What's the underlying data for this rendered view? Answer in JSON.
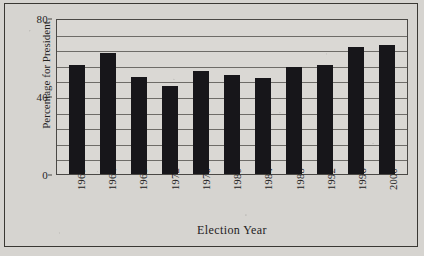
{
  "chart_data": {
    "type": "bar",
    "title": "",
    "xlabel": "Election Year",
    "ylabel": "Percentage for President",
    "categories": [
      "1960",
      "1964",
      "1968",
      "1972",
      "1976",
      "1980",
      "1984",
      "1988",
      "1992",
      "1996",
      "2000"
    ],
    "values": [
      56,
      62,
      50,
      45,
      53,
      51,
      49,
      55,
      56,
      65,
      66
    ],
    "ylim": [
      0,
      80
    ],
    "ytick_labels": [
      "0",
      "40",
      "80"
    ],
    "ytick_values": [
      0,
      40,
      80
    ],
    "gridlines": [
      8,
      16,
      24,
      32,
      40,
      48,
      56,
      64,
      72
    ],
    "grid": true,
    "legend": "none",
    "bar_color": "#17161a",
    "plot_background": "#dad8d4",
    "axis_color": "#4a4845",
    "page_background": "#d6d4d0"
  }
}
